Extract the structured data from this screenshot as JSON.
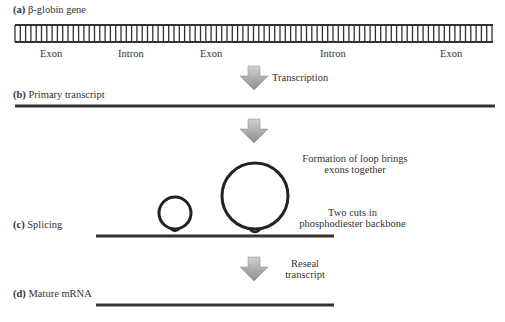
{
  "panels": {
    "a": {
      "letter": "(a)",
      "title": "β-globin gene",
      "segments": [
        "Exon",
        "Intron",
        "Exon",
        "Intron",
        "Exon"
      ]
    },
    "b": {
      "letter": "(b)",
      "title": "Primary transcript"
    },
    "c": {
      "letter": "(c)",
      "title": "Splicing"
    },
    "d": {
      "letter": "(d)",
      "title": "Mature mRNA"
    }
  },
  "arrows": {
    "transcription": "Transcription",
    "loop_note_line1": "Formation of loop brings",
    "loop_note_line2": "exons together",
    "cuts_note_line1": "Two cuts in",
    "cuts_note_line2": "phosphodiester backbone",
    "reseal_line1": "Reseal",
    "reseal_line2": "transcript"
  },
  "colors": {
    "line": "#333333",
    "arrow_light": "#c8c8c8",
    "arrow_dark": "#8a8a8a"
  }
}
